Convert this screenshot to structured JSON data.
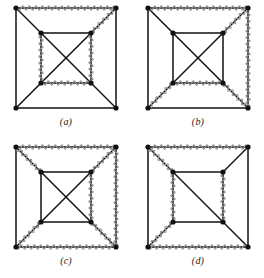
{
  "figure": {
    "background_color": "#ffffff",
    "edge_color": "#111111",
    "wavy_color": "#9a9a9a",
    "vertex_color": "#111111",
    "vertex_radius": 2.6,
    "edge_width": 1.5,
    "wavy_width": 1.2,
    "wave_amplitude": 2.2,
    "wave_period": 6.5
  },
  "geometry": {
    "outer": {
      "tl": [
        16,
        8
      ],
      "tr": [
        116,
        8
      ],
      "br": [
        116,
        108
      ],
      "bl": [
        16,
        108
      ]
    },
    "inner": {
      "tl": [
        41,
        33
      ],
      "tr": [
        91,
        33
      ],
      "br": [
        91,
        83
      ],
      "bl": [
        41,
        83
      ]
    }
  },
  "panels": [
    {
      "id": "a",
      "caption": "(a)",
      "edges": [
        {
          "name": "outer-top",
          "from": "outer.tl",
          "to": "outer.tr",
          "wavy": true
        },
        {
          "name": "outer-right",
          "from": "outer.tr",
          "to": "outer.br",
          "wavy": false
        },
        {
          "name": "outer-bottom",
          "from": "outer.br",
          "to": "outer.bl",
          "wavy": false
        },
        {
          "name": "outer-left",
          "from": "outer.bl",
          "to": "outer.tl",
          "wavy": false
        },
        {
          "name": "inner-top",
          "from": "inner.tl",
          "to": "inner.tr",
          "wavy": false
        },
        {
          "name": "inner-right",
          "from": "inner.tr",
          "to": "inner.br",
          "wavy": true
        },
        {
          "name": "inner-bottom",
          "from": "inner.br",
          "to": "inner.bl",
          "wavy": true
        },
        {
          "name": "inner-left",
          "from": "inner.bl",
          "to": "inner.tl",
          "wavy": true
        },
        {
          "name": "spoke-tl",
          "from": "outer.tl",
          "to": "inner.tl",
          "wavy": false
        },
        {
          "name": "spoke-tr",
          "from": "outer.tr",
          "to": "inner.tr",
          "wavy": true
        },
        {
          "name": "spoke-br",
          "from": "outer.br",
          "to": "inner.br",
          "wavy": false
        },
        {
          "name": "spoke-bl",
          "from": "outer.bl",
          "to": "inner.bl",
          "wavy": false
        },
        {
          "name": "inner-diag-1",
          "from": "inner.tl",
          "to": "inner.br",
          "wavy": false
        },
        {
          "name": "inner-diag-2",
          "from": "inner.tr",
          "to": "inner.bl",
          "wavy": false
        }
      ]
    },
    {
      "id": "b",
      "caption": "(b)",
      "edges": [
        {
          "name": "outer-top",
          "from": "outer.tl",
          "to": "outer.tr",
          "wavy": true
        },
        {
          "name": "outer-right",
          "from": "outer.tr",
          "to": "outer.br",
          "wavy": true
        },
        {
          "name": "outer-bottom",
          "from": "outer.br",
          "to": "outer.bl",
          "wavy": false
        },
        {
          "name": "outer-left",
          "from": "outer.bl",
          "to": "outer.tl",
          "wavy": false
        },
        {
          "name": "inner-top",
          "from": "inner.tl",
          "to": "inner.tr",
          "wavy": false
        },
        {
          "name": "inner-right",
          "from": "inner.tr",
          "to": "inner.br",
          "wavy": false
        },
        {
          "name": "inner-bottom",
          "from": "inner.br",
          "to": "inner.bl",
          "wavy": true
        },
        {
          "name": "inner-left",
          "from": "inner.bl",
          "to": "inner.tl",
          "wavy": false
        },
        {
          "name": "spoke-tl",
          "from": "outer.tl",
          "to": "inner.tl",
          "wavy": false
        },
        {
          "name": "spoke-tr",
          "from": "outer.tr",
          "to": "inner.tr",
          "wavy": true
        },
        {
          "name": "spoke-br",
          "from": "outer.br",
          "to": "inner.br",
          "wavy": true
        },
        {
          "name": "spoke-bl",
          "from": "outer.bl",
          "to": "inner.bl",
          "wavy": true
        },
        {
          "name": "inner-diag-1",
          "from": "inner.tl",
          "to": "inner.br",
          "wavy": false
        },
        {
          "name": "inner-diag-2",
          "from": "inner.tr",
          "to": "inner.bl",
          "wavy": false
        }
      ]
    },
    {
      "id": "c",
      "caption": "(c)",
      "edges": [
        {
          "name": "outer-top",
          "from": "outer.tl",
          "to": "outer.tr",
          "wavy": true
        },
        {
          "name": "outer-right",
          "from": "outer.tr",
          "to": "outer.br",
          "wavy": true
        },
        {
          "name": "outer-bottom",
          "from": "outer.br",
          "to": "outer.bl",
          "wavy": true
        },
        {
          "name": "outer-left",
          "from": "outer.bl",
          "to": "outer.tl",
          "wavy": false
        },
        {
          "name": "inner-top",
          "from": "inner.tl",
          "to": "inner.tr",
          "wavy": false
        },
        {
          "name": "inner-right",
          "from": "inner.tr",
          "to": "inner.br",
          "wavy": true
        },
        {
          "name": "inner-bottom",
          "from": "inner.br",
          "to": "inner.bl",
          "wavy": false
        },
        {
          "name": "inner-left",
          "from": "inner.bl",
          "to": "inner.tl",
          "wavy": false
        },
        {
          "name": "spoke-tl",
          "from": "outer.tl",
          "to": "inner.tl",
          "wavy": true
        },
        {
          "name": "spoke-tr",
          "from": "outer.tr",
          "to": "inner.tr",
          "wavy": true
        },
        {
          "name": "spoke-br",
          "from": "outer.br",
          "to": "inner.br",
          "wavy": true
        },
        {
          "name": "spoke-bl",
          "from": "outer.bl",
          "to": "inner.bl",
          "wavy": true
        },
        {
          "name": "inner-diag-1",
          "from": "inner.tl",
          "to": "inner.br",
          "wavy": false
        },
        {
          "name": "inner-diag-2",
          "from": "inner.tr",
          "to": "inner.bl",
          "wavy": false
        }
      ]
    },
    {
      "id": "d",
      "caption": "(d)",
      "edges": [
        {
          "name": "outer-top",
          "from": "outer.tl",
          "to": "outer.tr",
          "wavy": true
        },
        {
          "name": "outer-right",
          "from": "outer.tr",
          "to": "outer.br",
          "wavy": false
        },
        {
          "name": "outer-bottom",
          "from": "outer.br",
          "to": "outer.bl",
          "wavy": true
        },
        {
          "name": "outer-left",
          "from": "outer.bl",
          "to": "outer.tl",
          "wavy": false
        },
        {
          "name": "inner-top",
          "from": "inner.tl",
          "to": "inner.tr",
          "wavy": false
        },
        {
          "name": "inner-right",
          "from": "inner.tr",
          "to": "inner.br",
          "wavy": true
        },
        {
          "name": "inner-bottom",
          "from": "inner.br",
          "to": "inner.bl",
          "wavy": false
        },
        {
          "name": "inner-left",
          "from": "inner.bl",
          "to": "inner.tl",
          "wavy": true
        },
        {
          "name": "spoke-tl",
          "from": "outer.tl",
          "to": "inner.tl",
          "wavy": true
        },
        {
          "name": "spoke-tr",
          "from": "outer.tr",
          "to": "inner.tr",
          "wavy": false
        },
        {
          "name": "spoke-br",
          "from": "outer.br",
          "to": "inner.br",
          "wavy": false
        },
        {
          "name": "spoke-bl",
          "from": "outer.bl",
          "to": "inner.bl",
          "wavy": true
        },
        {
          "name": "inner-diag-1",
          "from": "inner.tl",
          "to": "inner.br",
          "wavy": false
        }
      ]
    }
  ]
}
